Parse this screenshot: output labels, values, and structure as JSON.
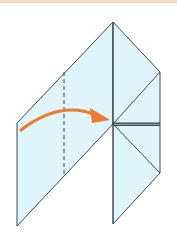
{
  "diagram": {
    "type": "origami-fold-step",
    "colors": {
      "paper": "#dff4fb",
      "edge": "#3a4a55",
      "arrow": "#ee7a2e",
      "top_bar": "#f6dcb4"
    },
    "elements": [
      "paper-shape",
      "valley-fold-line",
      "fold-arrow",
      "crease-lines"
    ]
  }
}
